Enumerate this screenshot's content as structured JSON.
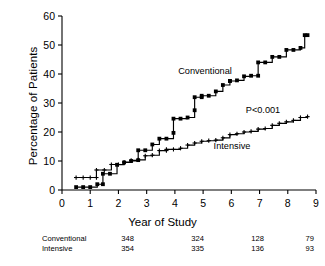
{
  "figure": {
    "background": "#ffffff",
    "line_color": "#000000",
    "marker_color": "#000000"
  },
  "annotations": {
    "conventional_label": "Conventional",
    "intensive_label": "Intensive",
    "pvalue": "P<0.001"
  },
  "risk_table": {
    "rows": [
      {
        "label": "Conventional",
        "values": [
          "348",
          "324",
          "128",
          "79"
        ]
      },
      {
        "label": "Intensive",
        "values": [
          "354",
          "335",
          "136",
          "93"
        ]
      }
    ]
  },
  "chart_data": {
    "type": "line",
    "subtype": "kaplan-meier-cumulative-incidence step curves",
    "title": "",
    "xlabel": "Year of Study",
    "ylabel": "Percentage of Patients",
    "xlim": [
      0,
      9
    ],
    "ylim": [
      0,
      60
    ],
    "xticks": [
      0,
      1,
      2,
      3,
      4,
      5,
      6,
      7,
      8,
      9
    ],
    "yticks": [
      0,
      10,
      20,
      30,
      40,
      50,
      60
    ],
    "xtick_labels": [
      "0",
      "1",
      "2",
      "3",
      "4",
      "5",
      "6",
      "7",
      "8",
      "9"
    ],
    "ytick_labels": [
      "0",
      "10",
      "20",
      "30",
      "40",
      "50",
      "60"
    ],
    "grid": false,
    "legend": "inline-annotation",
    "series": [
      {
        "name": "Conventional",
        "x": [
          0.5,
          0.75,
          1.0,
          1.25,
          1.45,
          1.45,
          1.7,
          1.95,
          2.2,
          2.45,
          2.7,
          2.7,
          2.95,
          3.2,
          3.45,
          3.7,
          3.95,
          3.95,
          4.2,
          4.45,
          4.7,
          4.7,
          4.95,
          4.95,
          5.2,
          5.45,
          5.7,
          5.95,
          5.95,
          6.2,
          6.45,
          6.7,
          6.95,
          6.95,
          7.2,
          7.45,
          7.7,
          7.95,
          8.2,
          8.45,
          8.6,
          8.7
        ],
        "y": [
          1.0,
          1.0,
          1.0,
          2.0,
          2.0,
          5.6,
          5.6,
          8.7,
          9.5,
          10.0,
          10.3,
          13.7,
          13.7,
          15.7,
          17.7,
          17.7,
          19.7,
          24.6,
          24.6,
          25.0,
          27.5,
          32.0,
          32.0,
          32.5,
          32.5,
          34.0,
          36.2,
          37.6,
          37.6,
          37.8,
          39.2,
          39.4,
          39.4,
          44.0,
          44.0,
          45.9,
          45.9,
          48.3,
          48.3,
          49.0,
          53.4,
          53.4
        ],
        "start_pct": 1.0,
        "end_pct": 53.4,
        "marker": "square"
      },
      {
        "name": "Intensive",
        "x": [
          0.5,
          0.75,
          1.0,
          1.22,
          1.22,
          1.5,
          1.75,
          2.0,
          2.2,
          2.45,
          2.7,
          2.95,
          3.2,
          3.45,
          3.7,
          3.7,
          3.95,
          4.2,
          4.45,
          4.7,
          4.95,
          5.2,
          5.45,
          5.7,
          5.95,
          6.2,
          6.45,
          6.7,
          6.95,
          7.2,
          7.45,
          7.7,
          7.95,
          8.2,
          8.45,
          8.7
        ],
        "y": [
          4.3,
          4.3,
          4.3,
          4.3,
          6.9,
          6.9,
          8.8,
          8.8,
          9.6,
          10.2,
          10.4,
          11.8,
          12.0,
          13.6,
          13.6,
          14.0,
          14.0,
          14.4,
          15.5,
          16.2,
          16.8,
          17.0,
          17.2,
          18.0,
          19.1,
          19.4,
          20.0,
          20.2,
          21.0,
          21.2,
          22.3,
          23.0,
          23.5,
          24.0,
          25.0,
          25.3
        ],
        "start_pct": 4.3,
        "end_pct": 25.3,
        "marker": "plus"
      }
    ]
  }
}
